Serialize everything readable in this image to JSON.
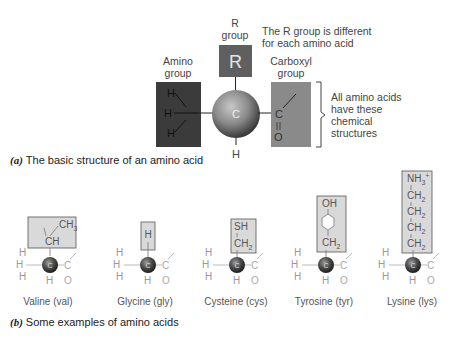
{
  "part_a": {
    "r_group_label": "R group",
    "r_group_line1": "R",
    "r_group_line2": "group",
    "r_symbol": "R",
    "r_note_line1": "The R group is different",
    "r_note_line2": "for each amino acid",
    "amino_label_line1": "Amino",
    "amino_label_line2": "group",
    "carboxyl_label_line1": "Carboxyl",
    "carboxyl_label_line2": "group",
    "central_atom": "C",
    "bottom_atom": "H",
    "amino_atoms": [
      "H",
      "H",
      "H"
    ],
    "carboxyl_atoms": [
      "C",
      "O"
    ],
    "bracket_note": [
      "All amino acids",
      "have these",
      "chemical",
      "structures"
    ],
    "caption_letter": "(a)",
    "caption_text": "The basic structure of an amino acid"
  },
  "part_b": {
    "amino_acids": [
      {
        "name": "Valine (val)",
        "r_group": [
          "CH3",
          "CH"
        ]
      },
      {
        "name": "Glycine (gly)",
        "r_group": [
          "H"
        ]
      },
      {
        "name": "Cysteine (cys)",
        "r_group": [
          "SH",
          "CH2"
        ]
      },
      {
        "name": "Tyrosine (tyr)",
        "r_group": [
          "OH",
          "benzene-ring",
          "CH2"
        ]
      },
      {
        "name": "Lysine (lys)",
        "r_group": [
          "NH3+",
          "CH2",
          "CH2",
          "CH2",
          "CH2"
        ]
      }
    ],
    "caption_letter": "(b)",
    "caption_text": "Some examples of amino acids"
  },
  "colors": {
    "amino_box": "#3b3b3b",
    "r_box": "#5f5f5f",
    "carboxyl_box": "#8a8a8a",
    "sphere_light": "#b5b5b5",
    "sphere_dark": "#3e3e3e",
    "r_group_box_b": "#d9d9d9"
  }
}
